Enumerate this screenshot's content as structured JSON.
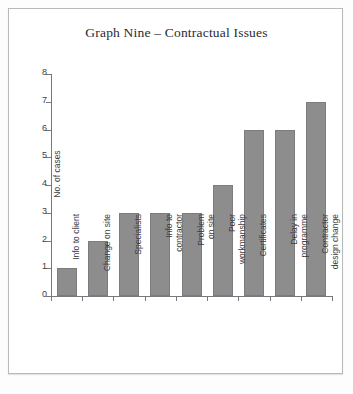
{
  "chart_data": {
    "type": "bar",
    "title": "Graph Nine – Contractual Issues",
    "xlabel": "",
    "ylabel": "No. of cases",
    "ylim": [
      0,
      8
    ],
    "ytick_labels": [
      "0",
      "1",
      "2",
      "3",
      "4",
      "5",
      "6",
      "7",
      "8"
    ],
    "ytick_values": [
      0,
      1,
      2,
      3,
      4,
      5,
      6,
      7,
      8
    ],
    "grid": false,
    "legend": false,
    "bar_color": "#8d8d8d",
    "bar_edge_color": "#7c7c7c",
    "categories": [
      "Info to client",
      "Change on site",
      "Specialists",
      "Info to\ncontractor",
      "Problem\non site",
      "Poor\nworkmanship",
      "Certificates",
      "Delay in\nprogramme",
      "Contractor\ndesign change"
    ],
    "values": [
      1,
      2,
      3,
      3,
      3,
      4,
      6,
      6,
      7
    ]
  },
  "page": {
    "border_color": "#b9b9b9",
    "background": "#ffffff"
  }
}
